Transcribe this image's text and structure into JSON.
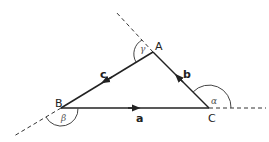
{
  "diagram": {
    "vertices": {
      "A": "A",
      "B": "B",
      "C": "C"
    },
    "vectors": {
      "a": "a",
      "b": "b",
      "c": "c"
    },
    "angles": {
      "alpha": "α",
      "beta": "β",
      "gamma": "γ"
    }
  }
}
